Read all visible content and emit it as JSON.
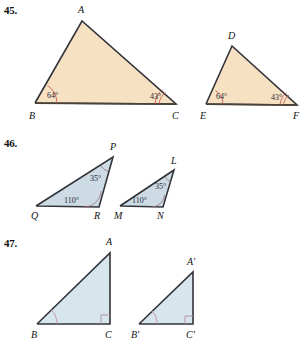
{
  "page": {
    "background_color": "#ffffff",
    "kind": "geometry-exercise-figures"
  },
  "colors": {
    "tan_fill": "#f7e1c3",
    "tan_stroke": "#33343a",
    "blue_fill": "#ccdbe4",
    "blue_stroke": "#33343a",
    "lightblue_fill": "#d7e6ed",
    "arc_red": "#c0504d",
    "arc_mauve": "#a06a86",
    "arc_pink": "#c08fa5",
    "rightangle": "#b08aa0",
    "text": "#111111"
  },
  "problems": [
    {
      "id": "45",
      "number_label": "45.",
      "fill_color": "#f7e1c3",
      "figures": [
        {
          "name": "triangle-abc",
          "vertices": [
            {
              "label": "A",
              "x": 82,
              "y": 21
            },
            {
              "label": "B",
              "x": 35,
              "y": 103
            },
            {
              "label": "C",
              "x": 176,
              "y": 104
            }
          ],
          "vertex_label_positions": [
            {
              "label": "A",
              "x": 78,
              "y": 13
            },
            {
              "label": "B",
              "x": 29,
              "y": 119
            },
            {
              "label": "C",
              "x": 172,
              "y": 119
            }
          ],
          "angles": [
            {
              "at": "B",
              "value": "64°",
              "arcs": 1,
              "x": 47,
              "y": 98
            },
            {
              "at": "C",
              "value": "43°",
              "arcs": 2,
              "x": 150,
              "y": 99
            }
          ]
        },
        {
          "name": "triangle-def",
          "vertices": [
            {
              "label": "D",
              "x": 232,
              "y": 46
            },
            {
              "label": "E",
              "x": 206,
              "y": 104
            },
            {
              "label": "F",
              "x": 297,
              "y": 105
            }
          ],
          "vertex_label_positions": [
            {
              "label": "D",
              "x": 228,
              "y": 39
            },
            {
              "label": "E",
              "x": 200,
              "y": 119
            },
            {
              "label": "F",
              "x": 293,
              "y": 119
            }
          ],
          "angles": [
            {
              "at": "E",
              "value": "64°",
              "arcs": 1,
              "x": 216,
              "y": 99
            },
            {
              "at": "F",
              "value": "43°",
              "arcs": 2,
              "x": 273,
              "y": 100
            }
          ]
        }
      ]
    },
    {
      "id": "46",
      "number_label": "46.",
      "fill_color": "#ccdbe4",
      "figures": [
        {
          "name": "triangle-pqr",
          "vertices": [
            {
              "label": "P",
              "x": 113,
              "y": 24
            },
            {
              "label": "Q",
              "x": 36,
              "y": 73
            },
            {
              "label": "R",
              "x": 99,
              "y": 74
            }
          ],
          "vertex_label_positions": [
            {
              "label": "P",
              "x": 110,
              "y": 17
            },
            {
              "label": "Q",
              "x": 31,
              "y": 86
            },
            {
              "label": "R",
              "x": 94,
              "y": 86
            }
          ],
          "angles": [
            {
              "at": "P",
              "value": "35°",
              "arcs": 1,
              "x": 96,
              "y": 47
            },
            {
              "at": "R",
              "value": "110°",
              "arcs": 1,
              "x": 69,
              "y": 70
            }
          ]
        },
        {
          "name": "triangle-lmn",
          "vertices": [
            {
              "label": "L",
              "x": 174,
              "y": 37
            },
            {
              "label": "M",
              "x": 120,
              "y": 73
            },
            {
              "label": "N",
              "x": 163,
              "y": 74
            }
          ],
          "vertex_label_positions": [
            {
              "label": "L",
              "x": 171,
              "y": 31
            },
            {
              "label": "M",
              "x": 115,
              "y": 86
            },
            {
              "label": "N",
              "x": 157,
              "y": 86
            }
          ],
          "angles": [
            {
              "at": "L",
              "value": "35°",
              "arcs": 1,
              "x": 160,
              "y": 54
            },
            {
              "at": "N",
              "value": "110°",
              "arcs": 1,
              "x": 138,
              "y": 70
            }
          ]
        }
      ]
    },
    {
      "id": "47",
      "number_label": "47.",
      "fill_color": "#d7e6ed",
      "figures": [
        {
          "name": "triangle-abc-right",
          "vertices": [
            {
              "label": "A",
              "x": 110,
              "y": 20
            },
            {
              "label": "B",
              "x": 37,
              "y": 91
            },
            {
              "label": "C",
              "x": 110,
              "y": 91
            }
          ],
          "vertex_label_positions": [
            {
              "label": "A",
              "x": 106,
              "y": 12
            },
            {
              "label": "B",
              "x": 31,
              "y": 105
            },
            {
              "label": "C",
              "x": 106,
              "y": 105
            }
          ],
          "angles": [
            {
              "at": "B",
              "value": "",
              "arcs": 1,
              "x": 0,
              "y": 0
            },
            {
              "at": "C",
              "value": "right-angle",
              "arcs": 0,
              "x": 0,
              "y": 0
            }
          ]
        },
        {
          "name": "triangle-abc-prime-right",
          "vertices": [
            {
              "label": "A'",
              "x": 193,
              "y": 39
            },
            {
              "label": "B'",
              "x": 139,
              "y": 91
            },
            {
              "label": "C'",
              "x": 193,
              "y": 91
            }
          ],
          "vertex_label_positions": [
            {
              "label": "A'",
              "x": 188,
              "y": 32
            },
            {
              "label": "B'",
              "x": 132,
              "y": 105
            },
            {
              "label": "C'",
              "x": 188,
              "y": 105
            }
          ],
          "angles": [
            {
              "at": "B'",
              "value": "",
              "arcs": 1,
              "x": 0,
              "y": 0
            },
            {
              "at": "C'",
              "value": "right-angle",
              "arcs": 0,
              "x": 0,
              "y": 0
            }
          ]
        }
      ]
    }
  ]
}
